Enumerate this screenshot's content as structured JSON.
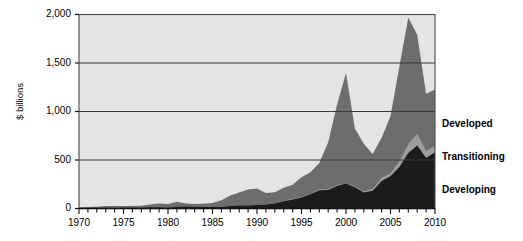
{
  "chart_data": {
    "type": "area",
    "stacked": true,
    "title": "",
    "subtitle": "",
    "xlabel": "",
    "ylabel": "$ billions",
    "xlim": [
      1970,
      2010
    ],
    "ylim": [
      0,
      2000
    ],
    "grid": true,
    "legend_position": "right",
    "x": [
      1970,
      1971,
      1972,
      1973,
      1974,
      1975,
      1976,
      1977,
      1978,
      1979,
      1980,
      1981,
      1982,
      1983,
      1984,
      1985,
      1986,
      1987,
      1988,
      1989,
      1990,
      1991,
      1992,
      1993,
      1994,
      1995,
      1996,
      1997,
      1998,
      1999,
      2000,
      2001,
      2002,
      2003,
      2004,
      2005,
      2006,
      2007,
      2008,
      2009,
      2010
    ],
    "y_ticks": [
      0,
      500,
      1000,
      1500,
      2000
    ],
    "y_tick_labels": [
      "0",
      "500",
      "1,000",
      "1,500",
      "2,000"
    ],
    "x_ticks": [
      1970,
      1975,
      1980,
      1985,
      1990,
      1995,
      2000,
      2005,
      2010
    ],
    "x_tick_labels": [
      "1970",
      "1975",
      "1980",
      "1985",
      "1990",
      "1995",
      "2000",
      "2005",
      "2010"
    ],
    "x_minor_tick_step": 1,
    "series": [
      {
        "name": "Developing",
        "color": "#1b1b1b",
        "stack_order": 1,
        "values": [
          4,
          5,
          6,
          7,
          6,
          8,
          8,
          9,
          12,
          14,
          9,
          18,
          21,
          17,
          16,
          15,
          16,
          26,
          32,
          31,
          36,
          41,
          51,
          74,
          94,
          114,
          146,
          189,
          191,
          232,
          257,
          218,
          166,
          183,
          284,
          332,
          427,
          573,
          650,
          520,
          580
        ]
      },
      {
        "name": "Transitioning",
        "color": "#9c9c9c",
        "stack_order": 2,
        "values": [
          0,
          0,
          0,
          0,
          0,
          0,
          0,
          0,
          0,
          0,
          0,
          0,
          0,
          0,
          0,
          0,
          0,
          0,
          0,
          0,
          1,
          2,
          4,
          6,
          6,
          5,
          6,
          9,
          9,
          10,
          7,
          10,
          11,
          20,
          30,
          31,
          57,
          91,
          122,
          72,
          68
        ]
      },
      {
        "name": "Developed",
        "color": "#6d6d6d",
        "stack_order": 3,
        "values": [
          9,
          11,
          12,
          18,
          19,
          18,
          18,
          20,
          28,
          38,
          38,
          52,
          30,
          29,
          34,
          42,
          69,
          109,
          133,
          166,
          170,
          116,
          112,
          134,
          146,
          204,
          222,
          271,
          483,
          830,
          1134,
          596,
          490,
          360,
          415,
          590,
          981,
          1306,
          1019,
          590,
          580
        ]
      }
    ],
    "legend": [
      {
        "label": "Developed",
        "color": "#6d6d6d"
      },
      {
        "label": "Transitioning",
        "color": "#9c9c9c"
      },
      {
        "label": "Developing",
        "color": "#1b1b1b"
      }
    ],
    "plot_background": "#e4e4e4",
    "axis_color": "#4a4a4a",
    "gridline_color": "#3a3a3a"
  }
}
